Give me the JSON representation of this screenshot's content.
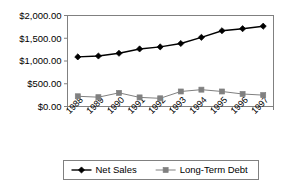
{
  "chart_data": {
    "type": "line",
    "title": "",
    "subtitle": "",
    "xlabel": "",
    "ylabel": "",
    "categories": [
      "1988",
      "1989",
      "1990",
      "1991",
      "1992",
      "1993",
      "1994",
      "1995",
      "1996",
      "1997"
    ],
    "series": [
      {
        "name": "Net Sales",
        "marker": "diamond",
        "color": "#000000",
        "values": [
          1090,
          1110,
          1170,
          1265,
          1310,
          1385,
          1520,
          1665,
          1710,
          1765
        ]
      },
      {
        "name": "Long-Term Debt",
        "marker": "square",
        "color": "#808080",
        "values": [
          225,
          205,
          300,
          200,
          180,
          330,
          370,
          330,
          275,
          250
        ]
      }
    ],
    "ylim": [
      0,
      2000
    ],
    "yticks": [
      0,
      500,
      1000,
      1500,
      2000
    ],
    "ytick_labels": [
      "$0.00",
      "$500.00",
      "$1,000.00",
      "$1,500.00",
      "$2,000.00"
    ],
    "grid": false,
    "legend_position": "bottom",
    "axis_color": "#808080",
    "plot_background": "#ffffff",
    "xtick_label_rotation": -45
  },
  "legend": {
    "entries": [
      {
        "label": "Net Sales",
        "marker": "diamond",
        "color": "#000000"
      },
      {
        "label": "Long-Term Debt",
        "marker": "square",
        "color": "#808080"
      }
    ]
  }
}
